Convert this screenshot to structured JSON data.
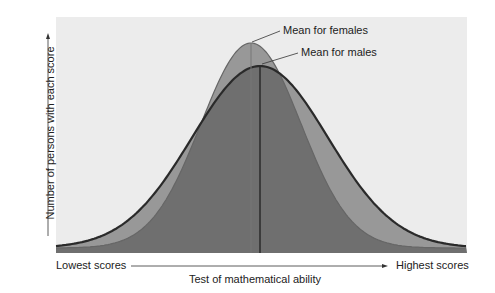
{
  "chart_data": {
    "type": "area",
    "title": "",
    "xlabel": "Test of mathematical ability",
    "ylabel": "Number of persons with each score",
    "x_axis_low_label": "Lowest scores",
    "x_axis_high_label": "Highest scores",
    "grid": false,
    "series": [
      {
        "name": "Females",
        "distribution": "normal",
        "relative_mean": 0.47,
        "relative_spread": "narrower",
        "relative_peak": "higher"
      },
      {
        "name": "Males",
        "distribution": "normal",
        "relative_mean": 0.495,
        "relative_spread": "wider",
        "relative_peak": "lower"
      }
    ],
    "annotations": [
      {
        "text": "Mean for females",
        "points_to": "female mean line"
      },
      {
        "text": "Mean for males",
        "points_to": "male mean line"
      }
    ]
  },
  "labels": {
    "mean_females": "Mean for females",
    "mean_males": "Mean for males",
    "lowest": "Lowest scores",
    "highest": "Highest scores",
    "xlabel": "Test of mathematical ability",
    "ylabel": "Number of persons with each score"
  },
  "colors": {
    "plot_bg": "#ececec",
    "single_fill": "#989898",
    "overlap_fill": "#6f6f6f",
    "outline": "#2a2a2a"
  }
}
